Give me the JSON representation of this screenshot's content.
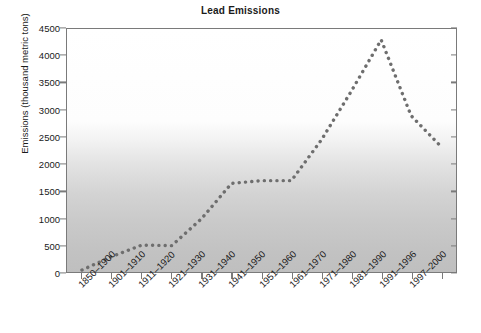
{
  "chart_data": {
    "type": "line",
    "title": "Lead Emissions",
    "xlabel": "",
    "ylabel": "Emissions (thousand metric tons)",
    "categories": [
      "1850–1900",
      "1901–1910",
      "1911–1920",
      "1921–1930",
      "1931–1940",
      "1941–1950",
      "1951–1960",
      "1961–1970",
      "1971–1980",
      "1981–1990",
      "1991–1996",
      "1997–2000"
    ],
    "values": [
      50,
      300,
      510,
      500,
      1650,
      1700,
      1700,
      3350,
      4300,
      2900,
      2330,
      2340
    ],
    "series": [
      {
        "name": "Lead emissions",
        "points": [
          {
            "category": "1850–1900",
            "value": 50
          },
          {
            "category": "1901–1910",
            "value": 300
          },
          {
            "category": "1911–1920",
            "value": 510
          },
          {
            "category": "1921–1930",
            "value": 500
          },
          {
            "category": "1931–1940",
            "value": 1000
          },
          {
            "category": "1941–1950",
            "value": 1650
          },
          {
            "category": "1951–1960",
            "value": 1700
          },
          {
            "category": "1961–1970",
            "value": 1700
          },
          {
            "category": "1971–1980",
            "value": 2450
          },
          {
            "category": "1981–1990",
            "value": 3350
          },
          {
            "category": "1991–1996",
            "value": 4300
          },
          {
            "category": "1997–2000",
            "value": 2900
          }
        ],
        "style": "dotted",
        "color": "#6e6e6e"
      }
    ],
    "plot_values": [
      50,
      300,
      510,
      500,
      1000,
      1650,
      1700,
      1700,
      2450,
      3350,
      4300,
      2900,
      2330
    ],
    "xtick_labels": [
      "1850–1900",
      "1901–1910",
      "1911–1920",
      "1921–1930",
      "1931–1940",
      "1941–1950",
      "1951–1960",
      "1961–1970",
      "1971–1980",
      "1981–1990",
      "1991–1996",
      "1997–2000"
    ],
    "ytick_labels": [
      "0",
      "500",
      "1000",
      "1500",
      "2000",
      "2500",
      "3000",
      "3500",
      "4000",
      "4500"
    ],
    "yticks": [
      0,
      500,
      1000,
      1500,
      2000,
      2500,
      3000,
      3500,
      4000,
      4500
    ],
    "ylim": [
      0,
      4500
    ],
    "grid": false,
    "legend": "none",
    "line_color": "#6e6e6e",
    "axis_color": "#7a7a7a",
    "background": "gradient-white-to-gray"
  }
}
